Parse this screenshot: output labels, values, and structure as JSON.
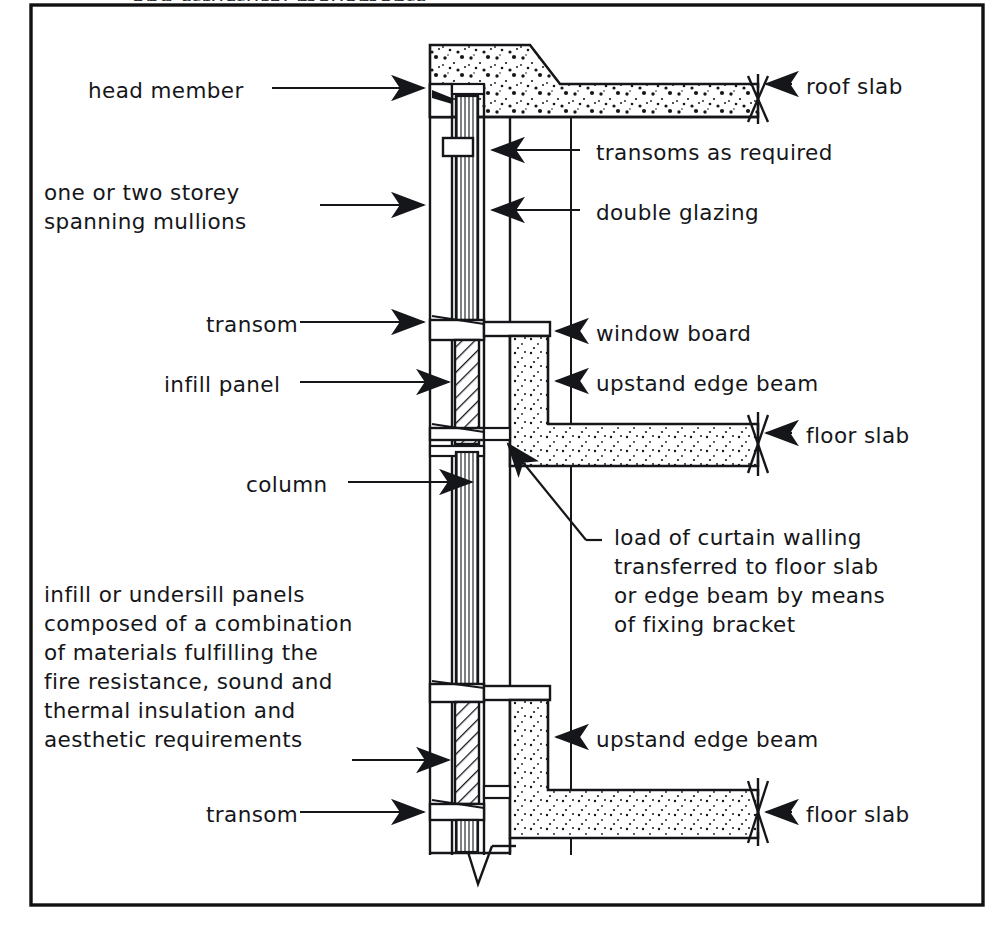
{
  "figure": {
    "title_clipped": "and structural movements.",
    "border_color": "#111111",
    "ink_color": "#15161a",
    "paper_color": "#ffffff"
  },
  "labels": {
    "head_member": "head member",
    "one_or_two_storey": "one or two storey\nspanning mullions",
    "transom_mid": "transom",
    "infill_panel": "infill panel",
    "column": "column",
    "infill_block": "infill or undersill panels\ncomposed of a combination\nof materials fulfilling the\nfire resistance, sound and\nthermal insulation and\naesthetic requirements",
    "transom_bottom": "transom",
    "roof_slab": "roof slab",
    "transoms_as_required": "transoms as required",
    "double_glazing": "double glazing",
    "window_board": "window board",
    "upstand_edge_beam_upper": "upstand edge beam",
    "floor_slab_upper": "floor slab",
    "load_transfer": "load of curtain walling\ntransferred to floor slab\nor edge beam by means\nof fixing bracket",
    "upstand_edge_beam_lower": "upstand edge beam",
    "floor_slab_lower": "floor slab"
  },
  "parts": [
    {
      "name": "head-member",
      "side": "left",
      "y": 88
    },
    {
      "name": "spanning-mullions",
      "side": "left",
      "y": 205
    },
    {
      "name": "transom-mid",
      "side": "left",
      "y": 322
    },
    {
      "name": "infill-panel",
      "side": "left",
      "y": 382
    },
    {
      "name": "column",
      "side": "left",
      "y": 482
    },
    {
      "name": "undersill-panels",
      "side": "left",
      "y": 760
    },
    {
      "name": "transom-bottom",
      "side": "left",
      "y": 812
    },
    {
      "name": "roof-slab",
      "side": "right",
      "y": 84
    },
    {
      "name": "transoms-as-required",
      "side": "right",
      "y": 150
    },
    {
      "name": "double-glazing",
      "side": "right",
      "y": 210
    },
    {
      "name": "window-board",
      "side": "right",
      "y": 331
    },
    {
      "name": "upstand-edge-beam-upper",
      "side": "right",
      "y": 381
    },
    {
      "name": "floor-slab-upper",
      "side": "right",
      "y": 433
    },
    {
      "name": "load-transfer-note",
      "side": "right",
      "y": 537
    },
    {
      "name": "upstand-edge-beam-lower",
      "side": "right",
      "y": 737
    },
    {
      "name": "floor-slab-lower",
      "side": "right",
      "y": 812
    }
  ]
}
